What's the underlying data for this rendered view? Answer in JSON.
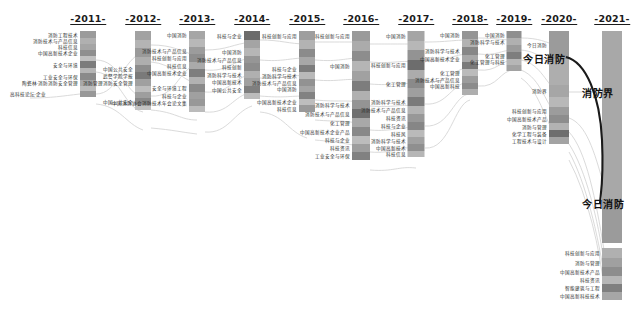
{
  "chart_data": {
    "type": "sankey-alluvial",
    "title": "",
    "subtitle": "",
    "xlabel": "",
    "ylabel": "",
    "grid": false,
    "legend_position": "none",
    "palette": {
      "node_light": "#b9b9b9",
      "node_mid": "#9d9d9d",
      "node_dark": "#6f6f6f",
      "node_darkest": "#4f4f4f",
      "flow": "#cfcfcf",
      "flow_highlight": "#1a1a1a",
      "text": "#2a2a2a",
      "background": "#ffffff"
    },
    "categories": [
      "2011",
      "2012",
      "2013",
      "2014",
      "2015",
      "2016",
      "2017",
      "2018",
      "2019",
      "2020",
      "2021"
    ],
    "axis_labels": [
      "-2011-",
      "-2012-",
      "-2013-",
      "-2014-",
      "-2015-",
      "-2016-",
      "-2017-",
      "-2018-",
      "-2019-",
      "-2020-",
      "-2021-"
    ],
    "highlight_series": {
      "name": "今日消防",
      "from_year": "2020",
      "to_year": "2021",
      "color": "#1a1a1a"
    },
    "annotations": [
      {
        "text": "今日消防",
        "year": "2020",
        "x": 565,
        "y": 58,
        "align": "right",
        "size": "big"
      },
      {
        "text": "消防界",
        "year": "2021",
        "x": 582,
        "y": 92,
        "align": "left",
        "size": "big"
      },
      {
        "text": "今日消防",
        "year": "2021",
        "x": 582,
        "y": 203,
        "align": "left",
        "size": "big"
      }
    ],
    "nodes": [
      {
        "year": "2011",
        "x": 88,
        "top": 31,
        "width": 16,
        "segments": [
          {
            "h": 7,
            "shade": "#9b9b9b",
            "label": "消防工程技术"
          },
          {
            "h": 6,
            "shade": "#b0b0b0",
            "label": "消防技术与产品信息"
          },
          {
            "h": 6,
            "shade": "#a5a5a5",
            "label": "科技信息"
          },
          {
            "h": 6,
            "shade": "#8f8f8f",
            "label": "中国高新技术企业"
          },
          {
            "h": 5,
            "shade": "#c0c0c0",
            "label": ""
          },
          {
            "h": 7,
            "shade": "#7c7c7c",
            "label": "安全与环境"
          },
          {
            "h": 5,
            "shade": "#b5b5b5",
            "label": ""
          },
          {
            "h": 7,
            "shade": "#8a8a8a",
            "label": "工业安全与环保"
          },
          {
            "h": 6,
            "shade": "#a8a8a8",
            "label": "陶瓷林·消防消防安全管理"
          },
          {
            "h": 5,
            "shade": "#bcbcbc",
            "label": ""
          },
          {
            "h": 6,
            "shade": "#989898",
            "label": ""
          }
        ]
      },
      {
        "year": "2012",
        "x": 143,
        "top": 31,
        "width": 16,
        "segments": [
          {
            "h": 9,
            "shade": "#a2a2a2",
            "label": ""
          },
          {
            "h": 8,
            "shade": "#b4b4b4",
            "label": ""
          },
          {
            "h": 9,
            "shade": "#9a9a9a",
            "label": ""
          },
          {
            "h": 8,
            "shade": "#aeaeae",
            "label": ""
          },
          {
            "h": 7,
            "shade": "#8d8d8d",
            "label": "中国公共安全"
          },
          {
            "h": 7,
            "shade": "#7a7a7a",
            "label": "武警学院学报"
          },
          {
            "h": 7,
            "shade": "#a0a0a0",
            "label": "消防管理消防安全管理"
          },
          {
            "h": 6,
            "shade": "#bdbdbd",
            "label": ""
          },
          {
            "h": 6,
            "shade": "#9e9e9e",
            "label": ""
          },
          {
            "h": 7,
            "shade": "#888888",
            "label": "中国公共安全"
          },
          {
            "h": 5,
            "shade": "#c2c2c2",
            "label": ""
          }
        ]
      },
      {
        "year": "2013",
        "x": 197,
        "top": 31,
        "width": 16,
        "segments": [
          {
            "h": 8,
            "shade": "#a6a6a6",
            "label": "中国消防"
          },
          {
            "h": 8,
            "shade": "#b8b8b8",
            "label": ""
          },
          {
            "h": 7,
            "shade": "#9c9c9c",
            "label": "消防技术与产品信息"
          },
          {
            "h": 8,
            "shade": "#8e8e8e",
            "label": "科技创新与应用"
          },
          {
            "h": 7,
            "shade": "#aaaaaa",
            "label": "科技信息"
          },
          {
            "h": 8,
            "shade": "#7e7e7e",
            "label": "中国高新技术企业"
          },
          {
            "h": 7,
            "shade": "#b2b2b2",
            "label": ""
          },
          {
            "h": 8,
            "shade": "#8a8a8a",
            "label": "安全与环境工程"
          },
          {
            "h": 7,
            "shade": "#a0a0a0",
            "label": "科技与企业"
          },
          {
            "h": 7,
            "shade": "#989898",
            "label": "中国消防协会消防技术年会论文集"
          },
          {
            "h": 6,
            "shade": "#bbbbbb",
            "label": ""
          }
        ]
      },
      {
        "year": "2014",
        "x": 252,
        "top": 31,
        "width": 16,
        "segments": [
          {
            "h": 9,
            "shade": "#6c6c6c",
            "label": "科技与企业"
          },
          {
            "h": 8,
            "shade": "#a4a4a4",
            "label": ""
          },
          {
            "h": 8,
            "shade": "#b6b6b6",
            "label": "中国消防"
          },
          {
            "h": 7,
            "shade": "#969696",
            "label": "消防技术与产品信息"
          },
          {
            "h": 8,
            "shade": "#8c8c8c",
            "label": "科技创新"
          },
          {
            "h": 7,
            "shade": "#b0b0b0",
            "label": "消防科学与技术"
          },
          {
            "h": 8,
            "shade": "#a0a0a0",
            "label": "中国高新技术"
          },
          {
            "h": 7,
            "shade": "#7f7f7f",
            "label": "中国公共安全"
          },
          {
            "h": 6,
            "shade": "#bcbcbc",
            "label": ""
          }
        ]
      },
      {
        "year": "2015",
        "x": 307,
        "top": 31,
        "width": 16,
        "segments": [
          {
            "h": 9,
            "shade": "#9e9e9e",
            "label": "科技创新与应用"
          },
          {
            "h": 9,
            "shade": "#b3b3b3",
            "label": ""
          },
          {
            "h": 8,
            "shade": "#8b8b8b",
            "label": ""
          },
          {
            "h": 8,
            "shade": "#a7a7a7",
            "label": ""
          },
          {
            "h": 7,
            "shade": "#7c7c7c",
            "label": "科技与企业"
          },
          {
            "h": 7,
            "shade": "#b9b9b9",
            "label": "消防科学与技术"
          },
          {
            "h": 7,
            "shade": "#929292",
            "label": "消防技术与产品信息"
          },
          {
            "h": 6,
            "shade": "#a4a4a4",
            "label": "中国消防"
          },
          {
            "h": 7,
            "shade": "#828282",
            "label": ""
          },
          {
            "h": 6,
            "shade": "#bdbdbd",
            "label": "中国高新技术企业"
          },
          {
            "h": 7,
            "shade": "#999999",
            "label": "科技信息"
          }
        ]
      },
      {
        "year": "2016",
        "x": 361,
        "top": 31,
        "width": 18,
        "segments": [
          {
            "h": 10,
            "shade": "#9a9a9a",
            "label": "科技创新与应用"
          },
          {
            "h": 10,
            "shade": "#ababab",
            "label": ""
          },
          {
            "h": 10,
            "shade": "#8d8d8d",
            "label": ""
          },
          {
            "h": 10,
            "shade": "#b5b5b5",
            "label": "中国消防"
          },
          {
            "h": 10,
            "shade": "#a1a1a1",
            "label": ""
          },
          {
            "h": 10,
            "shade": "#7d7d7d",
            "label": ""
          },
          {
            "h": 9,
            "shade": "#b0b0b0",
            "label": ""
          },
          {
            "h": 9,
            "shade": "#949494",
            "label": "消防科学与技术"
          },
          {
            "h": 9,
            "shade": "#6f6f6f",
            "label": "消防技术与产品信息"
          },
          {
            "h": 9,
            "shade": "#a8a8a8",
            "label": "化工管理"
          },
          {
            "h": 9,
            "shade": "#888888",
            "label": "中国高新技术企业产品"
          },
          {
            "h": 8,
            "shade": "#bcbcbc",
            "label": "科技与企业"
          },
          {
            "h": 8,
            "shade": "#9e9e9e",
            "label": "科技资讯"
          },
          {
            "h": 8,
            "shade": "#818181",
            "label": "工业安全与环保"
          }
        ]
      },
      {
        "year": "2017",
        "x": 416,
        "top": 31,
        "width": 17,
        "segments": [
          {
            "h": 10,
            "shade": "#a5a5a5",
            "label": "中国消防"
          },
          {
            "h": 9,
            "shade": "#b7b7b7",
            "label": ""
          },
          {
            "h": 10,
            "shade": "#939393",
            "label": ""
          },
          {
            "h": 10,
            "shade": "#6d6d6d",
            "label": "科技创新与应用"
          },
          {
            "h": 9,
            "shade": "#acacac",
            "label": ""
          },
          {
            "h": 9,
            "shade": "#8a8a8a",
            "label": "化工管理"
          },
          {
            "h": 9,
            "shade": "#9f9f9f",
            "label": ""
          },
          {
            "h": 9,
            "shade": "#7b7b7b",
            "label": "消防科学与技术"
          },
          {
            "h": 8,
            "shade": "#b3b3b3",
            "label": "消防技术与产品信息"
          },
          {
            "h": 8,
            "shade": "#989898",
            "label": "科技资讯"
          },
          {
            "h": 8,
            "shade": "#868686",
            "label": "科技与企业"
          },
          {
            "h": 7,
            "shade": "#bababa",
            "label": "科技风"
          },
          {
            "h": 7,
            "shade": "#a1a1a1",
            "label": "消防科学与技术"
          },
          {
            "h": 7,
            "shade": "#8f8f8f",
            "label": "中国高新技术"
          },
          {
            "h": 6,
            "shade": "#b6b6b6",
            "label": "科技信息"
          }
        ]
      },
      {
        "year": "2018",
        "x": 470,
        "top": 31,
        "width": 16,
        "segments": [
          {
            "h": 8,
            "shade": "#959595",
            "label": "中国消防"
          },
          {
            "h": 8,
            "shade": "#b2b2b2",
            "label": ""
          },
          {
            "h": 8,
            "shade": "#878787",
            "label": "消防科学与技术"
          },
          {
            "h": 7,
            "shade": "#a8a8a8",
            "label": "中国高新技术企业"
          },
          {
            "h": 7,
            "shade": "#7a7a7a",
            "label": ""
          },
          {
            "h": 7,
            "shade": "#bbbbbb",
            "label": "化工管理"
          },
          {
            "h": 7,
            "shade": "#9c9c9c",
            "label": "消防技术与产品信息"
          },
          {
            "h": 6,
            "shade": "#8b8b8b",
            "label": "中国高新科技"
          },
          {
            "h": 6,
            "shade": "#aeaeae",
            "label": ""
          }
        ]
      },
      {
        "year": "2019",
        "x": 514,
        "top": 31,
        "width": 15,
        "segments": [
          {
            "h": 7,
            "shade": "#8f8f8f",
            "label": "中国消防"
          },
          {
            "h": 7,
            "shade": "#b0b0b0",
            "label": "消防科学与技术"
          },
          {
            "h": 7,
            "shade": "#9b9b9b",
            "label": ""
          },
          {
            "h": 7,
            "shade": "#7e7e7e",
            "label": "化工管理"
          },
          {
            "h": 6,
            "shade": "#b6b6b6",
            "label": "化工管理与科技"
          },
          {
            "h": 6,
            "shade": "#a2a2a2",
            "label": ""
          }
        ]
      },
      {
        "year": "2020",
        "x": 559,
        "top": 31,
        "width": 20,
        "segments": [
          {
            "h": 28,
            "shade": "#9b9b9b",
            "label": "今日消防"
          },
          {
            "h": 26,
            "shade": "#aeaeae",
            "label": ""
          },
          {
            "h": 12,
            "shade": "#a6a6a6",
            "label": "消防界"
          },
          {
            "h": 10,
            "shade": "#b8b8b8",
            "label": ""
          },
          {
            "h": 8,
            "shade": "#9c9c9c",
            "label": "科技创新与应用"
          },
          {
            "h": 8,
            "shade": "#8d8d8d",
            "label": "中国高新技术产品"
          },
          {
            "h": 7,
            "shade": "#b2b2b2",
            "label": "消防与管理"
          },
          {
            "h": 7,
            "shade": "#6e6e6e",
            "label": "化学工程与装备"
          },
          {
            "h": 7,
            "shade": "#a3a3a3",
            "label": "工程技术与设计"
          }
        ]
      },
      {
        "year": "2021",
        "x": 612,
        "top": 31,
        "width": 20,
        "segments": [
          {
            "h": 168,
            "shade": "#a8a8a8",
            "label": ""
          },
          {
            "h": 44,
            "shade": "#9b9b9b",
            "label": ""
          }
        ]
      },
      {
        "year": "2021b",
        "x": 612,
        "top": 248,
        "width": 20,
        "segments": [
          {
            "h": 10,
            "shade": "#b0b0b0",
            "label": "科技创新与应用"
          },
          {
            "h": 9,
            "shade": "#a0a0a0",
            "label": "消防与管理"
          },
          {
            "h": 9,
            "shade": "#8d8d8d",
            "label": "中国高新技术产品"
          },
          {
            "h": 8,
            "shade": "#b6b6b6",
            "label": "科技资讯"
          },
          {
            "h": 8,
            "shade": "#7f7f7f",
            "label": "智能建筑与工程"
          },
          {
            "h": 8,
            "shade": "#a6a6a6",
            "label": "中国高新科技技术"
          }
        ]
      }
    ],
    "left_tail_label": "高科技论坛·企业",
    "flows_note": "thin light-gray bezier links between adjacent year columns"
  }
}
